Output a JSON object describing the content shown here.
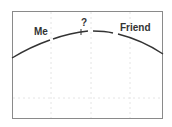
{
  "diagram": {
    "labels": {
      "me": "Me",
      "question": "?",
      "friend": "Friend"
    },
    "colors": {
      "curve": "#333333",
      "frame": "#8a8a8a",
      "grid": "#e2e2e2"
    }
  }
}
